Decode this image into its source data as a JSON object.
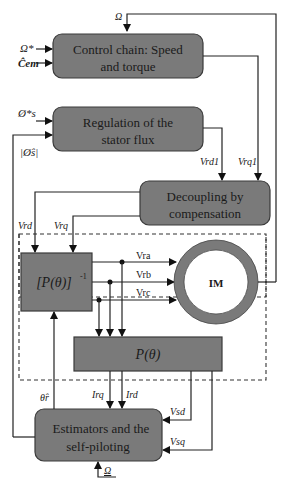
{
  "blocks": {
    "control_chain": {
      "line1": "Control chain: Speed",
      "line2": "and torque"
    },
    "stator_flux": {
      "line1": "Regulation of the",
      "line2": "stator flux"
    },
    "decoupling": {
      "line1": "Decoupling by",
      "line2": "compensation"
    },
    "inverse_park": {
      "label": "[P(θ)]",
      "sup": "-1"
    },
    "park": {
      "label": "P(θ)"
    },
    "estimators": {
      "line1": "Estimators and the",
      "line2": "self-piloting"
    },
    "motor": {
      "label": "IM"
    }
  },
  "signals": {
    "omega_top": "Ω",
    "omega_ref": "Ω*",
    "torque_ref": "Ĉem",
    "flux_ref": "Ø*s",
    "flux_est": "|Ø̂s|",
    "vrd1": "Vrd1",
    "vrq1": "Vrq1",
    "vrd": "Vrd",
    "vrq": "Vrq",
    "vra": "Vra",
    "vrb": "Vrb",
    "vrc": "Vrc",
    "theta_est": "θ̂r",
    "irq": "Irq",
    "ird": "Ird",
    "vsd": "Vsd",
    "vsq": "Vsq",
    "omega_bottom": "Ω"
  },
  "colors": {
    "block_fill": "#7a7a7a",
    "line": "#222222",
    "background": "#ffffff"
  }
}
